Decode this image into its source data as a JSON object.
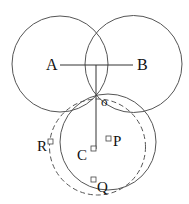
{
  "diagram": {
    "width": 189,
    "height": 204,
    "stroke_color": "#555555",
    "label_color": "#111111",
    "circles": [
      {
        "name": "circle-A",
        "cx": 60,
        "cy": 64,
        "r": 48,
        "style": "solid"
      },
      {
        "name": "circle-B",
        "cx": 133.5,
        "cy": 64,
        "r": 48.5,
        "style": "solid"
      },
      {
        "name": "circle-C",
        "cx": 108,
        "cy": 142,
        "r": 48,
        "style": "solid"
      },
      {
        "name": "circle-dashed",
        "cx": 97.5,
        "cy": 147,
        "r": 48,
        "style": "dashed"
      }
    ],
    "segments": [
      {
        "name": "segment-AB",
        "x1": 60,
        "y1": 65,
        "x2": 133,
        "y2": 65
      },
      {
        "name": "segment-vertical",
        "x1": 96,
        "y1": 65,
        "x2": 96,
        "y2": 149
      }
    ],
    "points": [
      {
        "name": "A",
        "label": "A",
        "label_x": 46,
        "label_y": 70,
        "label_size": 16
      },
      {
        "name": "B",
        "label": "B",
        "label_x": 137,
        "label_y": 70,
        "label_size": 16
      },
      {
        "name": "O",
        "label": "o",
        "label_x": 101,
        "label_y": 106,
        "label_size": 13
      },
      {
        "name": "R",
        "label": "R",
        "label_x": 37,
        "label_y": 151,
        "label_size": 15,
        "marker_x": 48,
        "marker_y": 139
      },
      {
        "name": "C",
        "label": "C",
        "label_x": 77,
        "label_y": 160,
        "label_size": 15,
        "marker_x": 91,
        "marker_y": 146
      },
      {
        "name": "P",
        "label": "P",
        "label_x": 113,
        "label_y": 146,
        "label_size": 15,
        "marker_x": 106,
        "marker_y": 136
      },
      {
        "name": "Q",
        "label": "Q",
        "label_x": 97,
        "label_y": 192,
        "label_size": 15,
        "marker_x": 91,
        "marker_y": 177
      }
    ],
    "marker_size": 5
  }
}
